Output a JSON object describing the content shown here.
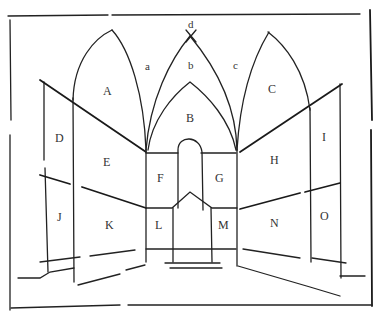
{
  "figure": {
    "region_labels": {
      "A": "A",
      "B": "B",
      "C": "C",
      "D": "D",
      "E": "E",
      "F": "F",
      "G": "G",
      "H": "H",
      "I": "I",
      "J": "J",
      "K": "K",
      "L": "L",
      "M": "M",
      "N": "N",
      "O": "O"
    },
    "vault_labels": {
      "a": "a",
      "b": "b",
      "c": "c",
      "d": "d"
    }
  }
}
